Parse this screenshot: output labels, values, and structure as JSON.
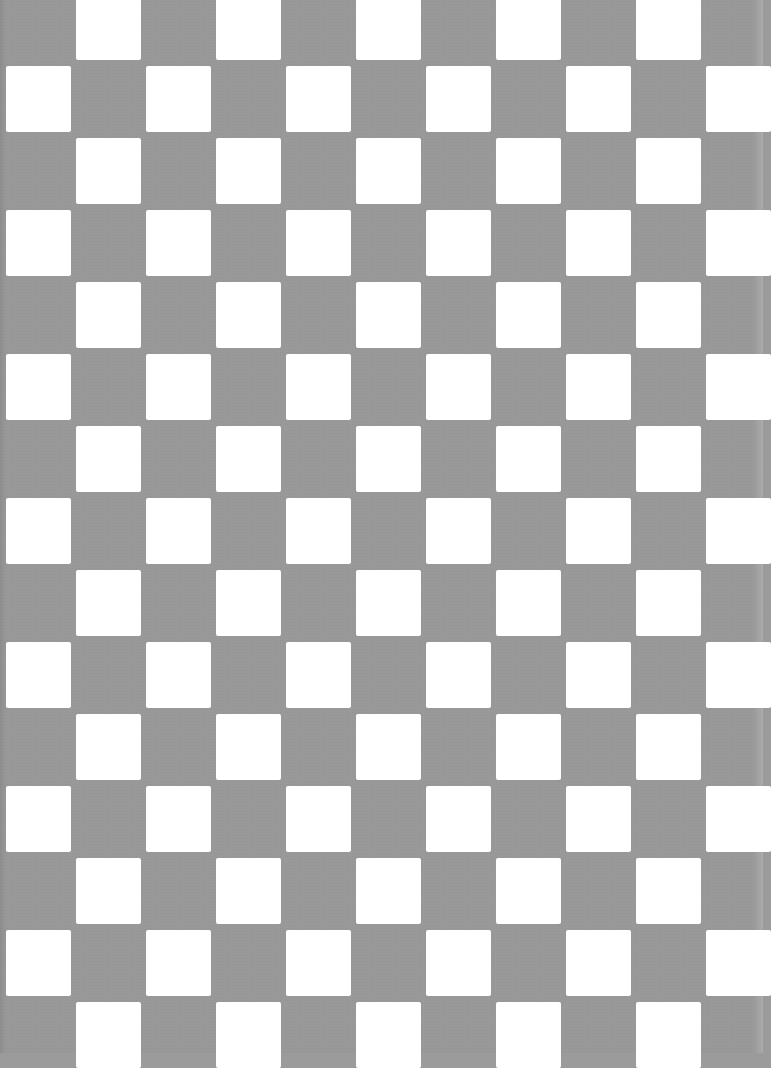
{
  "image": {
    "description": "Scanned gray and white checkerboard pattern",
    "width": 763,
    "height": 1053,
    "colors": {
      "background": "#999999",
      "square": "#ffffff"
    },
    "grid": {
      "column_pitch": 70,
      "row_pitch": 72,
      "square_width": 65,
      "square_height": 66,
      "first_row_top": -6,
      "even_row_first_x": 76,
      "odd_row_first_x": 6,
      "rows": 15,
      "cols": 11
    }
  }
}
